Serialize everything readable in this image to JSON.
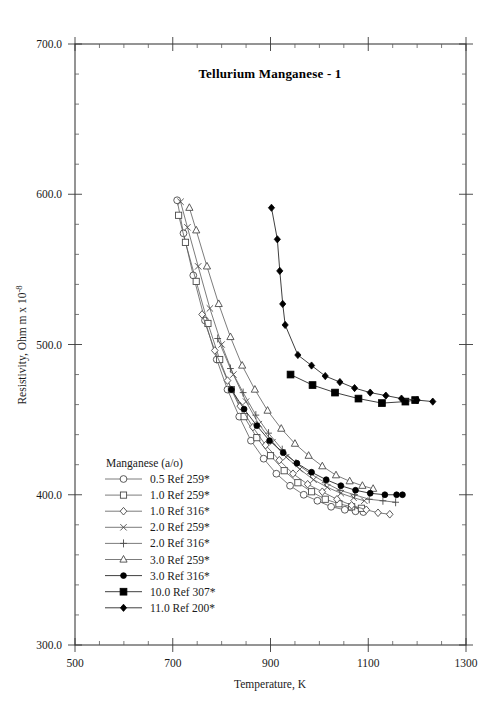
{
  "chart_data": {
    "type": "line",
    "title": "Tellurium Manganese - 1",
    "xlabel": "Temperature,  K",
    "ylabel": "Resistivity, Ohm m x 10",
    "ylabel_exponent": "-8",
    "xlim": [
      500,
      1300
    ],
    "ylim": [
      300.0,
      700.0
    ],
    "xticks": [
      500,
      700,
      900,
      1100,
      1300
    ],
    "xtick_labels": [
      "500",
      "700",
      "900",
      "1100",
      "1300"
    ],
    "yticks": [
      300.0,
      400.0,
      500.0,
      600.0,
      700.0
    ],
    "ytick_labels": [
      "300.0",
      "400.0",
      "500.0",
      "600.0",
      "700.0"
    ],
    "x_minor_step": 50,
    "y_minor_step": 20,
    "grid": false,
    "legend_position": "inside-lower-left",
    "legend_title": "Manganese (a/o)",
    "series": [
      {
        "name": "0.5 Ref 259*",
        "marker": "open-circle",
        "x": [
          709,
          722,
          742,
          766,
          790,
          812,
          836,
          860,
          886,
          912,
          940,
          968,
          996,
          1024,
          1052,
          1074,
          1090
        ],
        "y": [
          596.0,
          574.0,
          546.0,
          516.0,
          490.0,
          470.0,
          452.0,
          436.0,
          424.0,
          414.0,
          406.0,
          400.0,
          396.0,
          392.0,
          390.0,
          389.0,
          388.5
        ]
      },
      {
        "name": "1.0 Ref 259*",
        "marker": "open-square",
        "x": [
          712,
          726,
          748,
          772,
          796,
          820,
          846,
          872,
          900,
          928,
          956,
          984,
          1012,
          1040,
          1066,
          1086
        ],
        "y": [
          586.0,
          568.0,
          542.0,
          514.0,
          490.0,
          470.0,
          452.0,
          438.0,
          426.0,
          416.0,
          408.0,
          402.0,
          397.0,
          394.0,
          392.0,
          391.0
        ]
      },
      {
        "name": "1.0 Ref 316*",
        "marker": "open-diamond",
        "x": [
          760,
          786,
          812,
          838,
          864,
          890,
          918,
          946,
          976,
          1006,
          1036,
          1066,
          1096,
          1120,
          1144
        ],
        "y": [
          520.0,
          496.0,
          476.0,
          459.0,
          445.0,
          433.0,
          423.0,
          414.0,
          407.0,
          402.0,
          397.0,
          393.0,
          390.0,
          388.0,
          387.0
        ]
      },
      {
        "name": "2.0 Ref 259*",
        "marker": "cross-x",
        "x": [
          716,
          730,
          752,
          776,
          800,
          824,
          850,
          876,
          904,
          932,
          960,
          988,
          1016,
          1044,
          1070,
          1092
        ],
        "y": [
          595.0,
          578.0,
          552.0,
          524.0,
          500.0,
          480.0,
          462.0,
          447.0,
          435.0,
          425.0,
          417.0,
          410.0,
          405.0,
          401.0,
          398.0,
          396.0
        ]
      },
      {
        "name": "2.0 Ref 316*",
        "marker": "plus",
        "x": [
          792,
          818,
          844,
          870,
          896,
          924,
          952,
          982,
          1012,
          1042,
          1072,
          1102,
          1130,
          1156
        ],
        "y": [
          504.0,
          484.0,
          468.0,
          453.0,
          441.0,
          430.0,
          421.0,
          414.0,
          408.0,
          403.0,
          400.0,
          397.0,
          396.0,
          395.0
        ]
      },
      {
        "name": "3.0 Ref 259*",
        "marker": "open-triangle",
        "x": [
          734,
          748,
          770,
          794,
          818,
          842,
          868,
          894,
          922,
          950,
          978,
          1006,
          1034,
          1062,
          1088,
          1110
        ],
        "y": [
          591.0,
          576.0,
          552.0,
          527.0,
          505.0,
          486.0,
          470.0,
          456.0,
          444.0,
          434.0,
          426.0,
          419.0,
          413.0,
          409.0,
          406.0,
          404.0
        ]
      },
      {
        "name": "3.0 Ref 316*",
        "marker": "filled-circle",
        "x": [
          820,
          846,
          872,
          898,
          926,
          954,
          984,
          1014,
          1044,
          1074,
          1104,
          1134,
          1158,
          1170
        ],
        "y": [
          470.0,
          457.0,
          446.0,
          436.0,
          428.0,
          421.0,
          415.0,
          410.0,
          406.0,
          403.0,
          401.0,
          400.0,
          400.0,
          400.0
        ]
      },
      {
        "name": "10.0 Ref 307*",
        "marker": "filled-square",
        "x": [
          941,
          986,
          1032,
          1080,
          1128,
          1176,
          1196
        ],
        "y": [
          480.0,
          473.0,
          468.0,
          464.0,
          461.0,
          462.0,
          463.0
        ]
      },
      {
        "name": "11.0 Ref 200*",
        "marker": "filled-diamond",
        "x": [
          902,
          914,
          919,
          925,
          930,
          956,
          984,
          1012,
          1042,
          1072,
          1104,
          1136,
          1168,
          1200,
          1232
        ],
        "y": [
          591.0,
          570.0,
          549.0,
          527.0,
          513.0,
          493.0,
          486.0,
          479.0,
          475.0,
          471.0,
          468.0,
          466.0,
          464.0,
          463.0,
          462.0
        ]
      }
    ]
  }
}
